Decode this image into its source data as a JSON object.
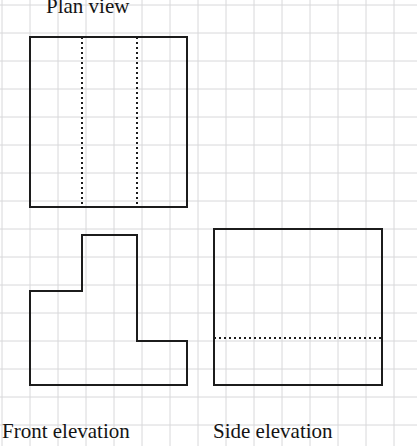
{
  "page": {
    "width": 417,
    "height": 446,
    "background_color": "#ffffff"
  },
  "grid": {
    "cell_size": 28,
    "origin_x": 2,
    "origin_y": 5,
    "line_color": "#d8d8da",
    "line_width": 1,
    "columns": 15,
    "rows": 16
  },
  "style": {
    "outline_color": "#1c1c1c",
    "outline_width": 2,
    "hidden_line_color": "#1c1c1c",
    "hidden_line_width": 2,
    "hidden_line_dash": "2 3"
  },
  "labels": {
    "plan_view": "Plan view",
    "front_elevation": "Front elevation",
    "side_elevation": "Side elevation"
  },
  "drawing_data": {
    "type": "orthographic-projection",
    "views": [
      {
        "name": "plan-view",
        "label": "Plan view",
        "shape": "rectangle",
        "outline_points": "30,37 187,37 187,207 30,207 30,37",
        "bounds": {
          "x": 30,
          "y": 37,
          "width": 157,
          "height": 170
        },
        "grid_units": {
          "width": 5.6,
          "height": 6.1
        },
        "hidden_lines": [
          {
            "name": "hidden-line-left",
            "x1": 82,
            "y1": 37,
            "x2": 82,
            "y2": 207
          },
          {
            "name": "hidden-line-right",
            "x1": 137,
            "y1": 37,
            "x2": 137,
            "y2": 207
          }
        ]
      },
      {
        "name": "front-elevation",
        "label": "Front elevation",
        "shape": "stepped-polygon",
        "outline_points": "30,291 82,291 82,235 137,235 137,341 187,341 187,385 30,385 30,291",
        "bounds": {
          "x": 30,
          "y": 235,
          "width": 157,
          "height": 150
        },
        "hidden_lines": []
      },
      {
        "name": "side-elevation",
        "label": "Side elevation",
        "shape": "square",
        "outline_points": "214,229 382,229 382,385 214,385 214,229",
        "bounds": {
          "x": 214,
          "y": 229,
          "width": 168,
          "height": 156
        },
        "hidden_lines": [
          {
            "name": "hidden-line-horizontal",
            "x1": 214,
            "y1": 338,
            "x2": 382,
            "y2": 338
          }
        ]
      }
    ]
  }
}
